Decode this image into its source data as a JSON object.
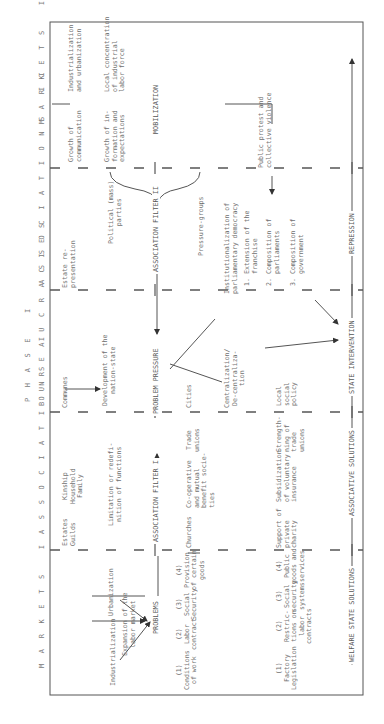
{
  "phase_title": "P H A S E   I",
  "columns": [
    {
      "id": "markets1",
      "header": "M A R K E T S   I"
    },
    {
      "id": "associations1",
      "header": "A S S O C I A T I O N S   I"
    },
    {
      "id": "bureaucracies",
      "header": "B U R E A U C R A C I E S"
    },
    {
      "id": "associations2",
      "header": "A S S O C I A T I O N S   I I"
    },
    {
      "id": "markets2",
      "header": "M A R K E T S   I I"
    }
  ],
  "row1": {
    "markets1": {
      "industrialization": "Industrialization",
      "urbanization": "Urbanization",
      "expansion": "Expansion of the\nlabor market"
    },
    "associations1_estates": "Estates\nGuilds",
    "associations1_kinship": "Kinship\nHousehold\nFamily",
    "associations1_limitation": "Limitation or redefi-\nnition of functions",
    "bureaucracies_communes": "Communes",
    "bureaucracies_development": "Development of the\nnation-state",
    "associations2_estate": "Estate re-\npresentation",
    "associations2_parties": "Political (mass)\nparties",
    "associations2_pressure": "Pressure-groups",
    "markets2_growth_comm": "Growth of\ncommunication",
    "markets2_industrialization": "Industrialization\nand urbanization",
    "markets2_growth_info": "Growth of in-\nformation and\nexpectations",
    "markets2_local": "Local concentration\nof industrial\nlabor force"
  },
  "mid_flow": {
    "problems": "PROBLEMS",
    "filter1": "ASSOCIATION FILTER I",
    "problem_pressure": "PROBLEM PRESSURE",
    "filter2": "ASSOCIATION FILTER II",
    "mobilization": "MOBILIZATION"
  },
  "row2": {
    "problems_list": [
      {
        "num": "(1)",
        "text": "Conditions\nof work"
      },
      {
        "num": "(2)",
        "text": "Labor\ncontract"
      },
      {
        "num": "(3)",
        "text": "Social\nSecurity"
      },
      {
        "num": "(4)",
        "text": "Provision\nof certain\ngoods"
      }
    ],
    "churches": "Churches",
    "cooperative": "Co-operative\nand mutual\nbenefit socie-\nties",
    "trade_unions": "Trade\nunions",
    "cities": "Cities",
    "centralization": "Centralization/\nDe-centraliza-\ntion",
    "institutionalization": "Institutionalization of\nparliamentary democracy",
    "inst_items": [
      "1. Extension of the\n   franchise",
      "2. Composition of\n   parliaments",
      "3. Composition of\n   government"
    ],
    "public_protest": "Public protest and\ncollective violence"
  },
  "row3": {
    "solutions_list": [
      {
        "num": "(1)",
        "text": "Factory\nLegislation"
      },
      {
        "num": "(2)",
        "text": "Restric-\ntions on\nlabor\ncontracts"
      },
      {
        "num": "(3)",
        "text": "Social\nsecurity\nsystems"
      },
      {
        "num": "(4)",
        "text": "Public\ngoods and\nservices"
      }
    ],
    "support": "Support of\nprivate\ncharity",
    "subsidization": "Subsidization\nof voluntary\ninsurance",
    "strengthening": "Strength-\nning of\ntrade\nunions",
    "local_policy": "Local\nsocial\npolicy"
  },
  "bottom_flow": {
    "welfare": "WELFARE STATE SOLUTIONS",
    "associative": "ASSOCIATIVE SOLUTIONS",
    "state": "STATE INTERVENTION",
    "repression": "REPRESSION"
  }
}
